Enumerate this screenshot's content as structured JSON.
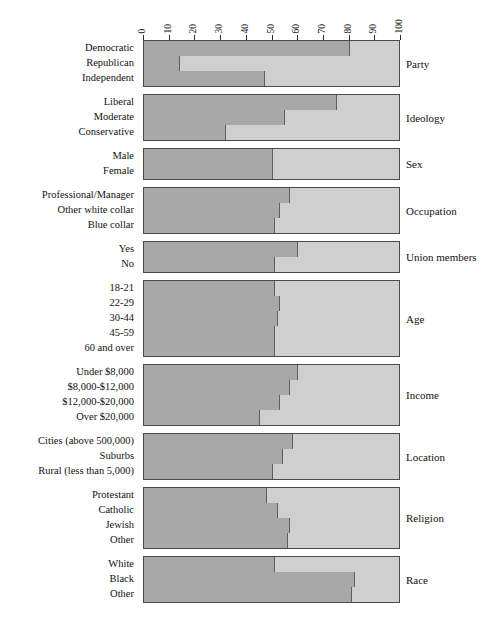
{
  "chart_data": {
    "type": "bar",
    "orientation": "horizontal",
    "stacked": true,
    "title": "",
    "subtitle": "",
    "xlabel": "",
    "ylabel": "",
    "xlim": [
      0,
      100
    ],
    "grid": false,
    "legend": "none",
    "axis": {
      "ticks": [
        0,
        10,
        20,
        30,
        40,
        50,
        60,
        70,
        80,
        90,
        100
      ],
      "tick_labels": [
        "0",
        "10",
        "20",
        "30",
        "40",
        "50",
        "60",
        "70",
        "80",
        "90",
        "100"
      ],
      "label_orientation": "vertical",
      "position": "top"
    },
    "colors": {
      "segment_dark": "#a8a8a8",
      "segment_light": "#cfcfcf",
      "border": "#4a4a4a",
      "text": "#111111"
    },
    "groups": [
      {
        "name": "Party",
        "categories": [
          "Democratic",
          "Republican",
          "Independent"
        ],
        "values": [
          80,
          14,
          47
        ]
      },
      {
        "name": "Ideology",
        "categories": [
          "Liberal",
          "Moderate",
          "Conservative"
        ],
        "values": [
          75,
          55,
          32
        ]
      },
      {
        "name": "Sex",
        "categories": [
          "Male",
          "Female"
        ],
        "values": [
          50,
          50
        ]
      },
      {
        "name": "Occupation",
        "categories": [
          "Professional/Manager",
          "Other white collar",
          "Blue collar"
        ],
        "values": [
          57,
          53,
          51
        ]
      },
      {
        "name": "Union members",
        "categories": [
          "Yes",
          "No"
        ],
        "values": [
          60,
          51
        ]
      },
      {
        "name": "Age",
        "categories": [
          "18-21",
          "22-29",
          "30-44",
          "45-59",
          "60 and over"
        ],
        "values": [
          51,
          53,
          52,
          51,
          51
        ]
      },
      {
        "name": "Income",
        "categories": [
          "Under $8,000",
          "$8,000-$12,000",
          "$12,000-$20,000",
          "Over $20,000"
        ],
        "values": [
          60,
          57,
          53,
          45
        ]
      },
      {
        "name": "Location",
        "categories": [
          "Cities (above 500,000)",
          "Suburbs",
          "Rural (less than 5,000)"
        ],
        "values": [
          58,
          54,
          50
        ]
      },
      {
        "name": "Religion",
        "categories": [
          "Protestant",
          "Catholic",
          "Jewish",
          "Other"
        ],
        "values": [
          48,
          52,
          57,
          56
        ]
      },
      {
        "name": "Race",
        "categories": [
          "White",
          "Black",
          "Other"
        ],
        "values": [
          51,
          82,
          81
        ]
      }
    ]
  }
}
